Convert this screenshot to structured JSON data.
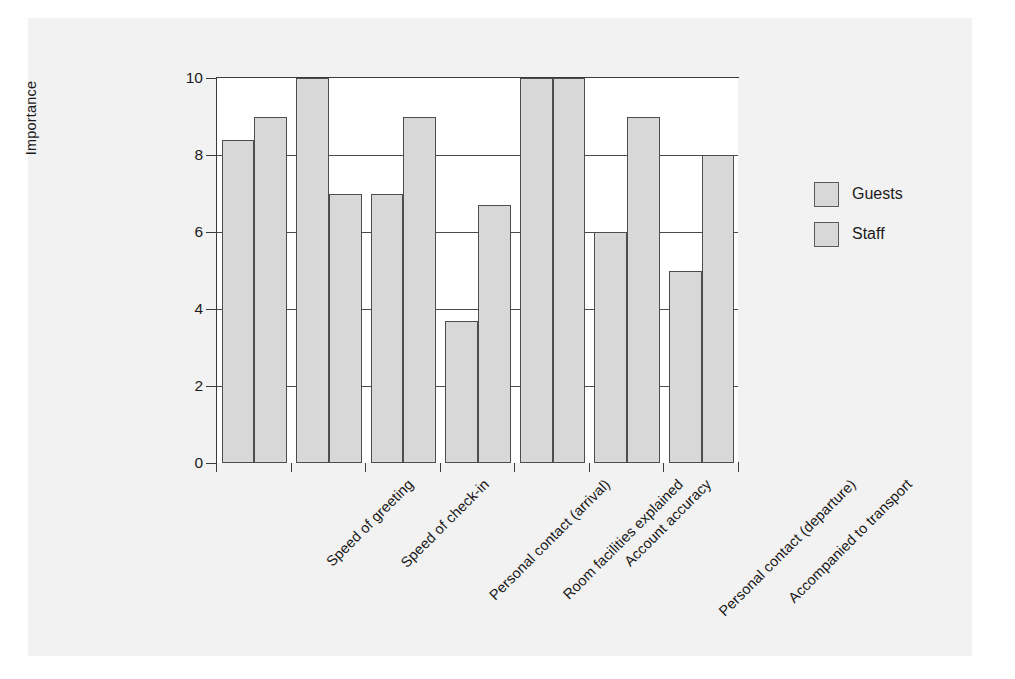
{
  "chart_data": {
    "type": "bar",
    "title": "",
    "xlabel": "",
    "ylabel": "Importance",
    "ylim": [
      0,
      10
    ],
    "yticks": [
      0,
      2,
      4,
      6,
      8,
      10
    ],
    "ytick_labels": [
      "0",
      "2",
      "4",
      "6",
      "8",
      "10"
    ],
    "grid": true,
    "legend_position": "right",
    "categories": [
      "Speed of greeting",
      "Speed of check-in",
      "Personal contact (arrival)",
      "Room facilities explained",
      "Account accuracy",
      "Personal contact (departure)",
      "Accompanied to transport"
    ],
    "series": [
      {
        "name": "Guests",
        "color": "#d8d8d8",
        "values": [
          8.4,
          10,
          7,
          3.7,
          10,
          6,
          5
        ]
      },
      {
        "name": "Staff",
        "color": "#d8d8d8",
        "values": [
          9,
          7,
          9,
          6.7,
          10,
          9,
          8
        ]
      }
    ]
  },
  "legend": {
    "items": [
      {
        "label": "Guests"
      },
      {
        "label": "Staff"
      }
    ]
  },
  "colors": {
    "figure_background": "#f2f2f2",
    "plot_background": "#ffffff",
    "bar_fill": "#d8d8d8",
    "bar_edge": "#4d4d4d",
    "axis": "#3a3a3a",
    "text": "#1b1b1b"
  }
}
